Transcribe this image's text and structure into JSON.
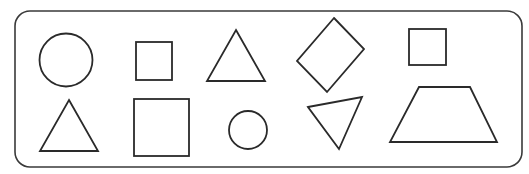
{
  "figure": {
    "width": 529,
    "height": 174,
    "stroke_color": "#2a2a2a",
    "frame": {
      "x": 15,
      "y": 11,
      "width": 507,
      "height": 156,
      "radius": 15,
      "color": "#3a3a3a"
    },
    "rows": [
      {
        "name": "top-row",
        "shapes": [
          {
            "type": "circle",
            "label": "circle-large",
            "cx": 66,
            "cy": 60,
            "r": 26.5
          },
          {
            "type": "rect",
            "label": "square-small",
            "x": 136,
            "y": 42,
            "w": 36,
            "h": 38
          },
          {
            "type": "polygon",
            "label": "triangle-up",
            "points": "236,30 265,81 207,81"
          },
          {
            "type": "polygon",
            "label": "diamond",
            "points": "334,18 364,49 327,92 297,61"
          },
          {
            "type": "rect",
            "label": "square-small-2",
            "x": 409,
            "y": 29,
            "w": 37,
            "h": 36
          }
        ]
      },
      {
        "name": "bottom-row",
        "shapes": [
          {
            "type": "polygon",
            "label": "triangle-up-2",
            "points": "69,100 98,151 40,151"
          },
          {
            "type": "rect",
            "label": "square-large",
            "x": 134,
            "y": 99,
            "w": 55,
            "h": 57
          },
          {
            "type": "circle",
            "label": "circle-small",
            "cx": 248,
            "cy": 130,
            "r": 19
          },
          {
            "type": "polygon",
            "label": "triangle-down",
            "points": "308,107 362,97 339,149"
          },
          {
            "type": "polygon",
            "label": "trapezoid",
            "points": "419,87 470,87 497,142 390,142"
          }
        ]
      }
    ]
  }
}
